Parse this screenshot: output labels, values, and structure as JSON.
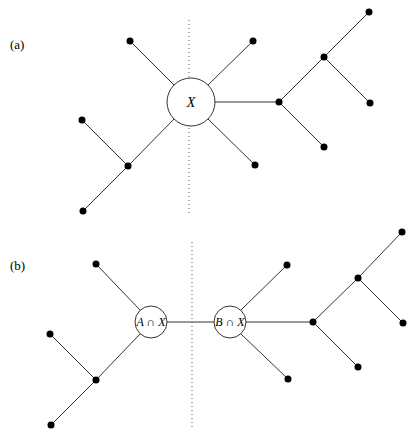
{
  "panels": [
    {
      "label": "(a)",
      "separator": {
        "x": 189,
        "y1": 20,
        "y2": 213
      },
      "circles": [
        {
          "id": "X",
          "label": "X",
          "cx": 191,
          "cy": 102,
          "r": 24
        }
      ],
      "nodes": [
        {
          "id": "a_tl",
          "x": 130,
          "y": 41
        },
        {
          "id": "a_tr",
          "x": 253,
          "y": 41
        },
        {
          "id": "a_br",
          "x": 255,
          "y": 165
        },
        {
          "id": "a_lj",
          "x": 128,
          "y": 166
        },
        {
          "id": "a_ll1",
          "x": 82,
          "y": 120
        },
        {
          "id": "a_ll2",
          "x": 83,
          "y": 211
        },
        {
          "id": "a_rj1",
          "x": 279,
          "y": 102
        },
        {
          "id": "a_rj2",
          "x": 324,
          "y": 57
        },
        {
          "id": "a_r1",
          "x": 369,
          "y": 12
        },
        {
          "id": "a_r2",
          "x": 370,
          "y": 103
        },
        {
          "id": "a_r3",
          "x": 324,
          "y": 147
        }
      ]
    },
    {
      "label": "(b)",
      "separator": {
        "x": 192,
        "y1": 242,
        "y2": 430
      },
      "circles": [
        {
          "id": "AX",
          "label": "A ∩ X",
          "cx": 151,
          "cy": 322,
          "r": 16
        },
        {
          "id": "BX",
          "label": "B ∩ X",
          "cx": 230,
          "cy": 322,
          "r": 16
        }
      ],
      "nodes": [
        {
          "id": "b_tl",
          "x": 96,
          "y": 264
        },
        {
          "id": "b_lj",
          "x": 96,
          "y": 380
        },
        {
          "id": "b_ll1",
          "x": 50,
          "y": 334
        },
        {
          "id": "b_ll2",
          "x": 51,
          "y": 425
        },
        {
          "id": "b_tr",
          "x": 287,
          "y": 265
        },
        {
          "id": "b_br",
          "x": 288,
          "y": 379
        },
        {
          "id": "b_rj1",
          "x": 313,
          "y": 322
        },
        {
          "id": "b_rj2",
          "x": 358,
          "y": 278
        },
        {
          "id": "b_r1",
          "x": 402,
          "y": 232
        },
        {
          "id": "b_r2",
          "x": 403,
          "y": 323
        },
        {
          "id": "b_r3",
          "x": 358,
          "y": 367
        }
      ]
    }
  ]
}
